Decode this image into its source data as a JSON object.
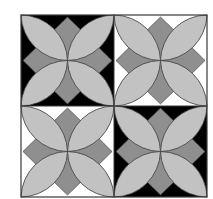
{
  "figure": {
    "grid": {
      "rows": 2,
      "cols": 2
    },
    "colors": {
      "petal": "#c2c2c2",
      "diamond": "#8f8f8f",
      "outline": "#3a3a3a",
      "dark_ground": "#000000",
      "light_ground": "#ffffff"
    },
    "tiles": [
      {
        "row": 0,
        "col": 0,
        "ground": "dark"
      },
      {
        "row": 0,
        "col": 1,
        "ground": "light"
      },
      {
        "row": 1,
        "col": 0,
        "ground": "light"
      },
      {
        "row": 1,
        "col": 1,
        "ground": "dark"
      }
    ]
  }
}
